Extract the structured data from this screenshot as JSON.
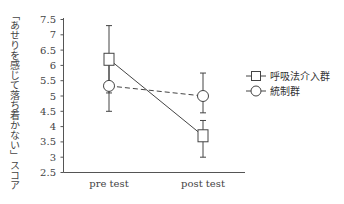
{
  "chart_data": {
    "type": "line",
    "title": "",
    "xlabel": "",
    "ylabel": "「あせりを感じて落ち着かない」スコア",
    "categories": [
      "pre test",
      "post test"
    ],
    "ylim": [
      2.5,
      7.5
    ],
    "yticks": [
      "7.5",
      "7",
      "6.5",
      "6",
      "5.5",
      "5",
      "4.5",
      "4",
      "3.5",
      "3",
      "2.5"
    ],
    "grid": false,
    "legend_position": "right",
    "series": [
      {
        "name": "呼吸法介入群",
        "marker": "square",
        "line_style": "solid",
        "values": [
          6.2,
          3.7
        ],
        "error_upper": [
          7.3,
          4.2
        ],
        "error_lower": [
          5.1,
          3.0
        ]
      },
      {
        "name": "統制群",
        "marker": "circle",
        "line_style": "dashed",
        "values": [
          5.33,
          5.0
        ],
        "error_upper": [
          6.2,
          5.75
        ],
        "error_lower": [
          4.5,
          4.45
        ]
      }
    ]
  },
  "legend": {
    "items": [
      {
        "label": "呼吸法介入群",
        "marker": "square-icon"
      },
      {
        "label": "統制群",
        "marker": "circle-icon"
      }
    ]
  },
  "axes": {
    "x_labels": [
      "pre test",
      "post test"
    ],
    "y_labels": [
      "7.5",
      "7",
      "6.5",
      "6",
      "5.5",
      "5",
      "4.5",
      "4",
      "3.5",
      "3",
      "2.5"
    ],
    "y_title": "「あせりを感じて落ち着かない」スコア"
  }
}
